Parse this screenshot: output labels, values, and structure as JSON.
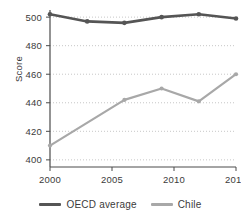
{
  "chart_data": {
    "type": "line",
    "title": "",
    "xlabel": "",
    "ylabel": "Score",
    "x": [
      2000,
      2003,
      2006,
      2009,
      2012,
      2015
    ],
    "xlim": [
      2000,
      2015
    ],
    "ylim": [
      395,
      505
    ],
    "xticks": [
      2000,
      2005,
      2010,
      2015
    ],
    "xticklabels": [
      "2000",
      "2005",
      "2010",
      "2015"
    ],
    "yticks": [
      400,
      420,
      440,
      460,
      480,
      500
    ],
    "yticklabels": [
      "400",
      "420",
      "440",
      "460",
      "480",
      "500"
    ],
    "grid": "horizontal-dotted",
    "legend_position": "bottom-center",
    "markers": "circle",
    "series": [
      {
        "name": "OECD average",
        "color": "#555555",
        "x": [
          2000,
          2003,
          2006,
          2009,
          2012,
          2015
        ],
        "values": [
          502,
          497,
          496,
          500,
          502,
          499
        ]
      },
      {
        "name": "Chile",
        "color": "#a8a8a8",
        "x": [
          2000,
          2006,
          2009,
          2012,
          2015
        ],
        "values": [
          410,
          442,
          450,
          441,
          460
        ]
      }
    ]
  },
  "axes": {
    "y_title": "Score"
  },
  "legend": {
    "items": [
      {
        "label": "OECD average",
        "color": "#555555"
      },
      {
        "label": "Chile",
        "color": "#a8a8a8"
      }
    ]
  }
}
